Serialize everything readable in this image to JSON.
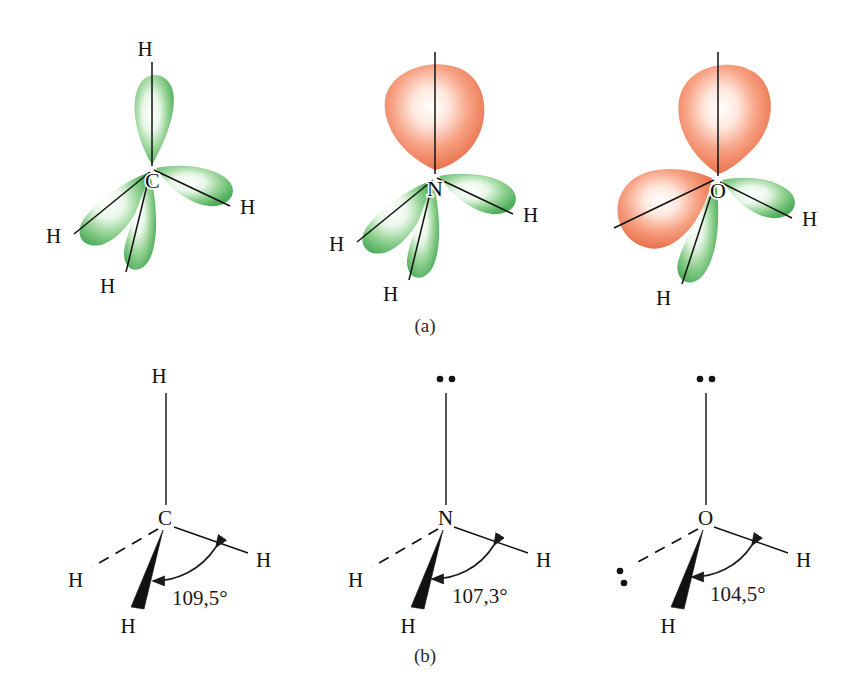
{
  "figure": {
    "panels": [
      {
        "id": "orbital-row",
        "caption": "(a)",
        "molecules": [
          {
            "center_atom": "C",
            "lobes": [
              {
                "kind": "bonding",
                "color": "#6bbf6b",
                "direction": "up"
              },
              {
                "kind": "bonding",
                "color": "#6bbf6b",
                "direction": "lower-left"
              },
              {
                "kind": "bonding",
                "color": "#6bbf6b",
                "direction": "down-left"
              },
              {
                "kind": "bonding",
                "color": "#6bbf6b",
                "direction": "right"
              }
            ],
            "hydrogen_labels": [
              "H",
              "H",
              "H",
              "H"
            ]
          },
          {
            "center_atom": "N",
            "lobes": [
              {
                "kind": "lone-pair",
                "color": "#f0845c",
                "direction": "up"
              },
              {
                "kind": "bonding",
                "color": "#6bbf6b",
                "direction": "lower-left"
              },
              {
                "kind": "bonding",
                "color": "#6bbf6b",
                "direction": "down-left"
              },
              {
                "kind": "bonding",
                "color": "#6bbf6b",
                "direction": "right"
              }
            ],
            "hydrogen_labels": [
              "H",
              "H",
              "H"
            ]
          },
          {
            "center_atom": "O",
            "lobes": [
              {
                "kind": "lone-pair",
                "color": "#f0845c",
                "direction": "up"
              },
              {
                "kind": "lone-pair",
                "color": "#f0845c",
                "direction": "left"
              },
              {
                "kind": "bonding",
                "color": "#6bbf6b",
                "direction": "down-left"
              },
              {
                "kind": "bonding",
                "color": "#6bbf6b",
                "direction": "right"
              }
            ],
            "hydrogen_labels": [
              "H",
              "H"
            ]
          }
        ]
      },
      {
        "id": "bond-angle-row",
        "caption": "(b)",
        "molecules": [
          {
            "center_atom": "C",
            "angle": "109,5°",
            "top_substituent": "H",
            "right_substituent": "H",
            "dashed_substituent": "H",
            "wedge_substituent": "H",
            "top_is_lone_pair": false,
            "dashed_is_lone_pair": false
          },
          {
            "center_atom": "N",
            "angle": "107,3°",
            "top_substituent": "lone-pair-dots",
            "right_substituent": "H",
            "dashed_substituent": "H",
            "wedge_substituent": "H",
            "top_is_lone_pair": true,
            "dashed_is_lone_pair": false
          },
          {
            "center_atom": "O",
            "angle": "104,5°",
            "top_substituent": "lone-pair-dots",
            "right_substituent": "H",
            "dashed_substituent": "lone-pair-dots",
            "wedge_substituent": "H",
            "top_is_lone_pair": true,
            "dashed_is_lone_pair": true
          }
        ]
      }
    ],
    "colors": {
      "bonding_orbital_green": "#6bbf6b",
      "lone_pair_orange": "#f0845c",
      "bond_line": "#111111",
      "background": "#ffffff"
    }
  }
}
